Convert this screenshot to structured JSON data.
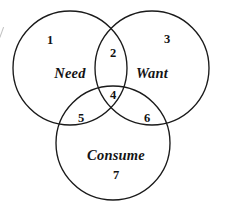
{
  "figure": {
    "type": "venn-diagram-3-set",
    "background_color": "#ffffff",
    "stroke_color": "#1a1a1a"
  },
  "sets": [
    {
      "key": "need",
      "label": "Need",
      "cx": 70,
      "cy": 68,
      "r": 57
    },
    {
      "key": "want",
      "label": "Want",
      "cx": 152,
      "cy": 68,
      "r": 57
    },
    {
      "key": "consume",
      "label": "Consume",
      "cx": 113,
      "cy": 143,
      "r": 57
    }
  ],
  "labels": {
    "need": "Need",
    "want": "Want",
    "consume": "Consume"
  },
  "regions": [
    {
      "id": "1",
      "number": "1",
      "belongs_to": [
        "need"
      ],
      "x": 50,
      "y": 40
    },
    {
      "id": "2",
      "number": "2",
      "belongs_to": [
        "need",
        "want"
      ],
      "x": 113,
      "y": 53
    },
    {
      "id": "3",
      "number": "3",
      "belongs_to": [
        "want"
      ],
      "x": 167,
      "y": 39
    },
    {
      "id": "4",
      "number": "4",
      "belongs_to": [
        "need",
        "want",
        "consume"
      ],
      "x": 113,
      "y": 95
    },
    {
      "id": "5",
      "number": "5",
      "belongs_to": [
        "need",
        "consume"
      ],
      "x": 81,
      "y": 118
    },
    {
      "id": "6",
      "number": "6",
      "belongs_to": [
        "want",
        "consume"
      ],
      "x": 147,
      "y": 118
    },
    {
      "id": "7",
      "number": "7",
      "belongs_to": [
        "consume"
      ],
      "x": 116,
      "y": 175
    }
  ],
  "label_positions": {
    "need": {
      "x": 70,
      "y": 73
    },
    "want": {
      "x": 152,
      "y": 73
    },
    "consume": {
      "x": 116,
      "y": 155
    }
  },
  "chart_data": {
    "type": "diagram",
    "title": "",
    "categories": [
      "Need",
      "Want",
      "Consume"
    ],
    "region_labels": [
      "1",
      "2",
      "3",
      "4",
      "5",
      "6",
      "7"
    ],
    "region_membership": [
      [
        "Need"
      ],
      [
        "Need",
        "Want"
      ],
      [
        "Want"
      ],
      [
        "Need",
        "Want",
        "Consume"
      ],
      [
        "Need",
        "Consume"
      ],
      [
        "Want",
        "Consume"
      ],
      [
        "Consume"
      ]
    ]
  }
}
